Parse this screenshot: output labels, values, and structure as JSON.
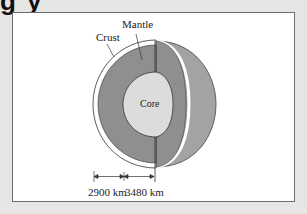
{
  "title_fragment": "g y",
  "diagram": {
    "labels": {
      "mantle": "Mantle",
      "crust": "Crust",
      "core": "Core"
    },
    "dimensions": [
      {
        "label": "2900 km",
        "refers_to": "mantle thickness"
      },
      {
        "label": "3480 km",
        "refers_to": "core radius"
      }
    ],
    "colors": {
      "background": "#e6e6e4",
      "frame": "#ffffff",
      "mantle": "#8f8f8f",
      "mantle_outer": "#9e9e9e",
      "core": "#dcdcdc",
      "crust": "#ffffff",
      "outline": "#333333"
    }
  }
}
